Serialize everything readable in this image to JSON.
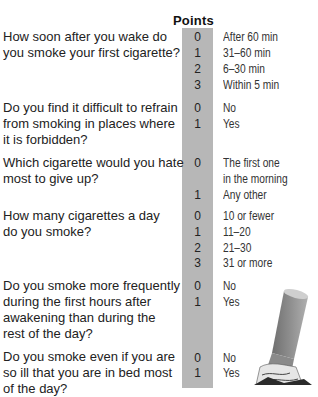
{
  "header": {
    "points_label": "Points"
  },
  "questions": [
    {
      "lines": [
        "How soon after you wake do",
        "you smoke your first cigarette?"
      ],
      "answers": [
        {
          "points": "0",
          "label": "After 60 min"
        },
        {
          "points": "1",
          "label": "31–60 min"
        },
        {
          "points": "2",
          "label": "6–30 min"
        },
        {
          "points": "3",
          "label": "Within 5 min"
        }
      ]
    },
    {
      "lines": [
        "Do you find it difficult to refrain",
        "from smoking in places where",
        "it is forbidden?"
      ],
      "answers": [
        {
          "points": "0",
          "label": "No"
        },
        {
          "points": "1",
          "label": "Yes"
        }
      ]
    },
    {
      "lines": [
        "Which cigarette would you hate",
        "most to give up?"
      ],
      "answers": [
        {
          "points": "0",
          "label": "The first one",
          "label2": "in the morning"
        },
        {
          "points": "1",
          "label": "Any other"
        }
      ]
    },
    {
      "lines": [
        "How many cigarettes a day",
        "do you smoke?"
      ],
      "answers": [
        {
          "points": "0",
          "label": "10 or fewer"
        },
        {
          "points": "1",
          "label": "11–20"
        },
        {
          "points": "2",
          "label": "21–30"
        },
        {
          "points": "3",
          "label": "31  or more"
        }
      ]
    },
    {
      "lines": [
        "Do you smoke more frequently",
        "during the first hours after",
        "awakening than during the",
        "rest of the day?"
      ],
      "answers": [
        {
          "points": "0",
          "label": "No"
        },
        {
          "points": "1",
          "label": "Yes"
        }
      ]
    },
    {
      "lines": [
        "Do you smoke even if you are",
        "so ill that you are in bed most",
        "of the day?"
      ],
      "answers": [
        {
          "points": "0",
          "label": "No"
        },
        {
          "points": "1",
          "label": "Yes"
        }
      ]
    }
  ],
  "image": {
    "icon": "cigarette-butt-icon"
  }
}
